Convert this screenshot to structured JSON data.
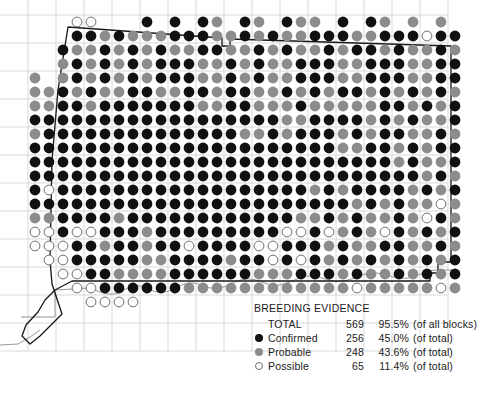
{
  "map": {
    "name": "connecticut-breeding-evidence-map",
    "region": "Connecticut",
    "grid": {
      "dot_pitch_x": 14.0,
      "dot_pitch_y": 14.0,
      "dot_radius": 5.4,
      "origin_x": 35.0,
      "origin_y": 22.0,
      "cols": 30,
      "rows": 21,
      "block_cell_size": 28
    },
    "colors": {
      "confirmed": "#111111",
      "probable": "#8c8c8c",
      "possible": "#ffffff",
      "possible_outline": "#6e6e6e",
      "block_grid": "#c9c9c9",
      "state_border": "#1a1a1a",
      "coastline": "#8a8a8a",
      "background": "#ffffff"
    },
    "rows_encoded": [
      "...00..2C2C2CB2CB2CBB2C2CB.B.B.BBBBBBBBBBBBBBBBBBBBBBB........",
      "...CCBCBBBCCCBBCBCBBCCCBBCCCPCCCBCBCBBBCBBCBCCB..............",
      "..CBBCBCBCBBCCBBCBCBBCBCCBCBBCBBBCBCBPPCCBBBCBB..............",
      "..BCBCBCBCCCBBCBCBBCCCBBCCCBBCCCBCBCBBBCBBCBCCB..............",
      "B.BCBCBCBCCCBBCBCBBCCCBBCCCBBCCCBCBCBBBCBBCBCCB..............",
      "BBCBCBBCCBBCCBCCBBCBCBCCBCBCBCBCBBCBCBCBBCBCBCB..............",
      "BBCCBCCCCCCCBBCCBBBCBBBBBCCBCBCBBCBCBCBBCBCBCCB..............",
      "CCCCCCCCCCCCCCCCCCBBCCCCBCBCBBCBBCBCBCBBCBBCCCB..............",
      "BCCCCCCCCCCCCCCBBCBCCCBCBCCBBCBCBCBCBBPCBCBBCCB..............",
      "CCCCCCCCCCCCCCCCCCCCCCBBCCBCBCCBCBCBBCBCBCBCCCB..............",
      "CCCCCCCCCCCCCCCCCCCCCCCCCCBCBBCBCBBPBCBCBCBCBCB..............",
      "CCCCCCCCCCCCCCCCCCCCCCCCCCCCBCBCBCBBCBCBBCBBCCB..............",
      "CPCCCCCCCCCCCCCCCCCCBCBCCCCBCBCBCBCPCBCPBCBCBCB..............",
      "CCCCCCCCCCCCCCCCCCCCCCCBCBCBBPBCBCBBCBCBCBCBCCB..............",
      "BBCCCCBCCCCCCCCCCCCBBCBCBBCBPCBCBCBBCBCBPCBBCCB..............",
      "PPCPPCCCBCCCCCCCCCPPCPBCBPCBCBCPBBCBCBPCBCBCCCB..............",
      "PPPCCBCCBCCPCCCCPPCCCBCBBCCBBCBPCBCBPCBBCBCBCCB..............",
      ".PPCCCCCBBCCCCBCCPCPCBCBCBCBCBCBBCBCBBCBCBBCCCB..............",
      "..PPCCBBBBCCCCCCBBBCCCBCBBCBCBCBCBBCBCBPBCBCBCB..............",
      "...PPCCCCCCBBBBBBBBBBBBPBBBBBPBCBCBBCBCBPBCBCBC..............",
      "....PPPP......................................................"
    ]
  },
  "legend": {
    "title": "BREEDING EVIDENCE",
    "rows": [
      {
        "swatch": "none",
        "label": "TOTAL",
        "count": "569",
        "percent": "95.5%",
        "of": "(of all blocks)"
      },
      {
        "swatch": "confirmed",
        "label": "Confirmed",
        "count": "256",
        "percent": "45.0%",
        "of": "(of total)"
      },
      {
        "swatch": "probable",
        "label": "Probable",
        "count": "248",
        "percent": "43.6%",
        "of": "(of total)"
      },
      {
        "swatch": "possible",
        "label": "Possible",
        "count": "65",
        "percent": "11.4%",
        "of": "(of total)"
      }
    ]
  }
}
